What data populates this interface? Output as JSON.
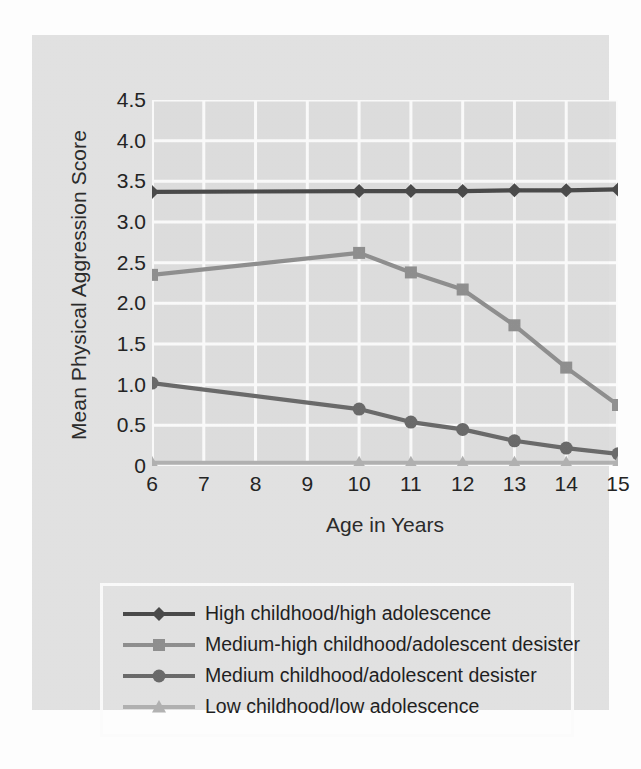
{
  "chart_data": {
    "type": "line",
    "title": "",
    "xlabel": "Age in  Years",
    "ylabel": "Mean Physical Aggression Score",
    "x": [
      6,
      7,
      8,
      9,
      10,
      11,
      12,
      13,
      14,
      15
    ],
    "xtick_labels": [
      "6",
      "7",
      "8",
      "9",
      "10",
      "11",
      "12",
      "13",
      "14",
      "15"
    ],
    "ytick_labels": [
      "4.5",
      "4.0",
      "3.5",
      "3.0",
      "2.5",
      "2.0",
      "1.5",
      "1.0",
      "0.5",
      "0"
    ],
    "ytick_values": [
      4.5,
      4.0,
      3.5,
      3.0,
      2.5,
      2.0,
      1.5,
      1.0,
      0.5,
      0
    ],
    "xlim": [
      6,
      15
    ],
    "ylim": [
      0,
      4.5
    ],
    "grid": true,
    "grid_color": "#fbfbfb",
    "plot_background": "#dedede",
    "legend_position": "below-plot",
    "series": [
      {
        "name": "High childhood/high adolescence",
        "marker": "diamond",
        "color": "#4a4a4a",
        "x": [
          6,
          10,
          11,
          12,
          13,
          14,
          15
        ],
        "values": [
          3.37,
          3.38,
          3.38,
          3.38,
          3.39,
          3.39,
          3.4
        ]
      },
      {
        "name": "Medium-high childhood/adolescent desister",
        "marker": "square",
        "color": "#909090",
        "x": [
          6,
          10,
          11,
          12,
          13,
          14,
          15
        ],
        "values": [
          2.35,
          2.62,
          2.38,
          2.17,
          1.73,
          1.21,
          0.75
        ]
      },
      {
        "name": "Medium childhood/adolescent desister",
        "marker": "circle",
        "color": "#6b6b6b",
        "x": [
          6,
          10,
          11,
          12,
          13,
          14,
          15
        ],
        "values": [
          1.02,
          0.7,
          0.54,
          0.45,
          0.31,
          0.22,
          0.15
        ]
      },
      {
        "name": "Low childhood/low adolescence",
        "marker": "triangle",
        "color": "#b2b2b2",
        "x": [
          6,
          10,
          11,
          12,
          13,
          14,
          15
        ],
        "values": [
          0.04,
          0.04,
          0.04,
          0.04,
          0.04,
          0.04,
          0.04
        ]
      }
    ]
  },
  "legend": {
    "items": [
      {
        "label": "High childhood/high adolescence",
        "marker": "diamond",
        "color": "#4a4a4a"
      },
      {
        "label": "Medium-high childhood/adolescent desister",
        "marker": "square",
        "color": "#909090"
      },
      {
        "label": "Medium childhood/adolescent desister",
        "marker": "circle",
        "color": "#6b6b6b"
      },
      {
        "label": "Low childhood/low adolescence",
        "marker": "triangle",
        "color": "#b2b2b2"
      }
    ]
  }
}
